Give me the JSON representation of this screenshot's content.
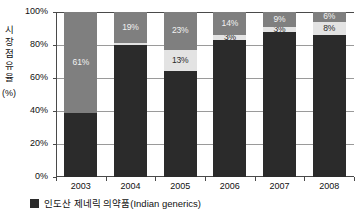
{
  "chart_data": {
    "type": "bar",
    "subtype": "100% stacked column",
    "title": "",
    "xlabel": "",
    "ylabel": "시장 점유율 (%)",
    "ylabel_lines": [
      "시",
      "장",
      "점",
      "유",
      "율"
    ],
    "ylabel_unit": "(%)",
    "categories": [
      "2003",
      "2004",
      "2005",
      "2006",
      "2007",
      "2008"
    ],
    "ylim": [
      0,
      100
    ],
    "yticks": [
      "0%",
      "20%",
      "40%",
      "60%",
      "80%",
      "100%"
    ],
    "ytick_values": [
      0,
      20,
      40,
      60,
      80,
      100
    ],
    "grid": true,
    "legend_position": "bottom-left",
    "series": [
      {
        "name": "인도산 제네릭 의약품(Indian generics)",
        "key": "bottom",
        "color": "#2b2b2b",
        "values": [
          39,
          80,
          64,
          83,
          88,
          86
        ],
        "labels": [
          "39%",
          "80%",
          "64%",
          "83%",
          "88%",
          "86%"
        ],
        "show_labels": [
          false,
          false,
          false,
          false,
          false,
          false
        ]
      },
      {
        "name": "",
        "key": "middle",
        "color": "#e3e3e3",
        "values": [
          0,
          1,
          13,
          3,
          3,
          8
        ],
        "labels": [
          "",
          "1%",
          "13%",
          "3%",
          "3%",
          "8%"
        ],
        "show_labels": [
          false,
          false,
          true,
          true,
          true,
          true
        ]
      },
      {
        "name": "",
        "key": "top",
        "color": "#7f7f7f",
        "values": [
          61,
          19,
          23,
          14,
          9,
          6
        ],
        "labels": [
          "61%",
          "19%",
          "23%",
          "14%",
          "9%",
          "6%"
        ],
        "show_labels": [
          true,
          true,
          true,
          true,
          true,
          true
        ]
      }
    ]
  },
  "legend": {
    "items": [
      {
        "label": "인도산 제네릭 의약품(Indian generics)",
        "color": "#2b2b2b"
      }
    ]
  }
}
